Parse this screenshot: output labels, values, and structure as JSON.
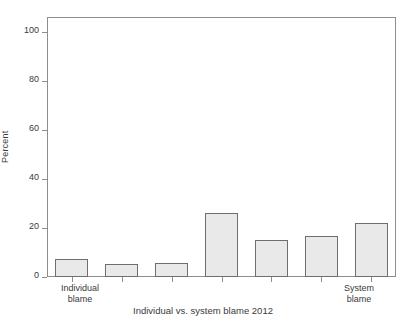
{
  "chart_data": {
    "type": "bar",
    "title": "Individual vs. system blame 2012",
    "xlabel": "",
    "ylabel": "Percent",
    "ylim": [
      0,
      110
    ],
    "yticks": [
      0,
      20,
      40,
      60,
      80,
      100
    ],
    "grid": false,
    "legend": null,
    "categories": [
      "Individual blame",
      "",
      "",
      "",
      "",
      "",
      "System blame"
    ],
    "tick_labels": [
      {
        "index": 0,
        "line1": "Individual",
        "line2": "blame"
      },
      {
        "index": 6,
        "line1": "System",
        "line2": "blame"
      }
    ],
    "values": [
      7.5,
      5.5,
      6,
      27,
      15.5,
      17.5,
      23
    ],
    "bar_fill": "#e9e9e9",
    "bar_edge": "#6e6e6e",
    "axis_color": "#8e8e8e"
  },
  "axis": {
    "y_tick_labels": [
      "100",
      "80",
      "60",
      "40",
      "20",
      "0"
    ],
    "y_axis_title": "Percent"
  },
  "footer": {
    "title": "Individual vs. system blame 2012"
  }
}
